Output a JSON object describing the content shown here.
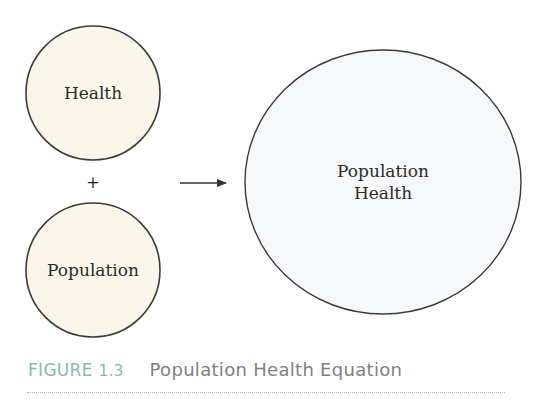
{
  "diagram": {
    "nodes": {
      "health": {
        "label": "Health",
        "fill": "#faf7ea"
      },
      "population": {
        "label": "Population",
        "fill": "#faf7ea"
      },
      "population_health": {
        "line1": "Population",
        "line2": "Health",
        "fill": "#f7f8fa"
      }
    },
    "operator": "+",
    "arrow": "right-arrow",
    "stroke_color": "#333333"
  },
  "caption": {
    "label": "FIGURE",
    "number": "1.3",
    "title": "Population Health Equation",
    "label_color": "#8bb8ad",
    "title_color": "#808080"
  }
}
